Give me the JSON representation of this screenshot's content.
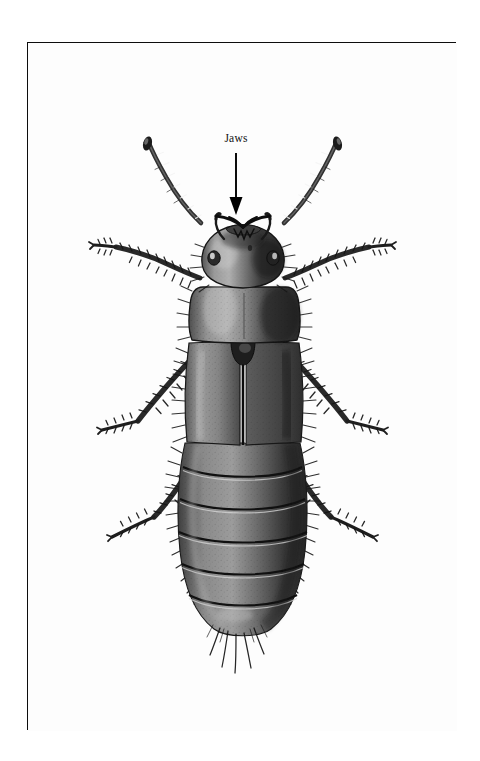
{
  "page": {
    "background_color": "#ffffff",
    "frame": {
      "border_color": "#0d0d0d",
      "fill_color": "#fdfdfd",
      "x": 27,
      "y": 42,
      "width": 429,
      "height": 688
    }
  },
  "illustration": {
    "type": "scientific-engraving",
    "subject": "rove beetle (Staphylinidae), dorsal view",
    "style": "black-and-white stipple / halftone engraving",
    "orientation": "head at top, abdomen at bottom",
    "body_parts": [
      "left antenna",
      "right antenna",
      "mandibles (jaws)",
      "head",
      "left eye",
      "right eye",
      "pronotum",
      "scutellum",
      "left elytron",
      "right elytron",
      "left foreleg",
      "right foreleg",
      "left midleg",
      "right midleg",
      "left hindleg",
      "right hindleg",
      "abdomen segments",
      "abdominal hairs",
      "cerci"
    ],
    "abdomen_segment_count": 6,
    "antenna_segment_count": 11,
    "tone_colors": {
      "darkest": "#1a1a1a",
      "dark": "#3a3a3a",
      "mid": "#6b6b6b",
      "light": "#9d9d9d",
      "highlight": "#cfcfcf"
    }
  },
  "annotations": [
    {
      "id": "jaws",
      "label": "Jaws",
      "text_color": "#111111",
      "arrow": {
        "direction": "down",
        "color": "#000000"
      },
      "points_at": "mandibles"
    }
  ]
}
